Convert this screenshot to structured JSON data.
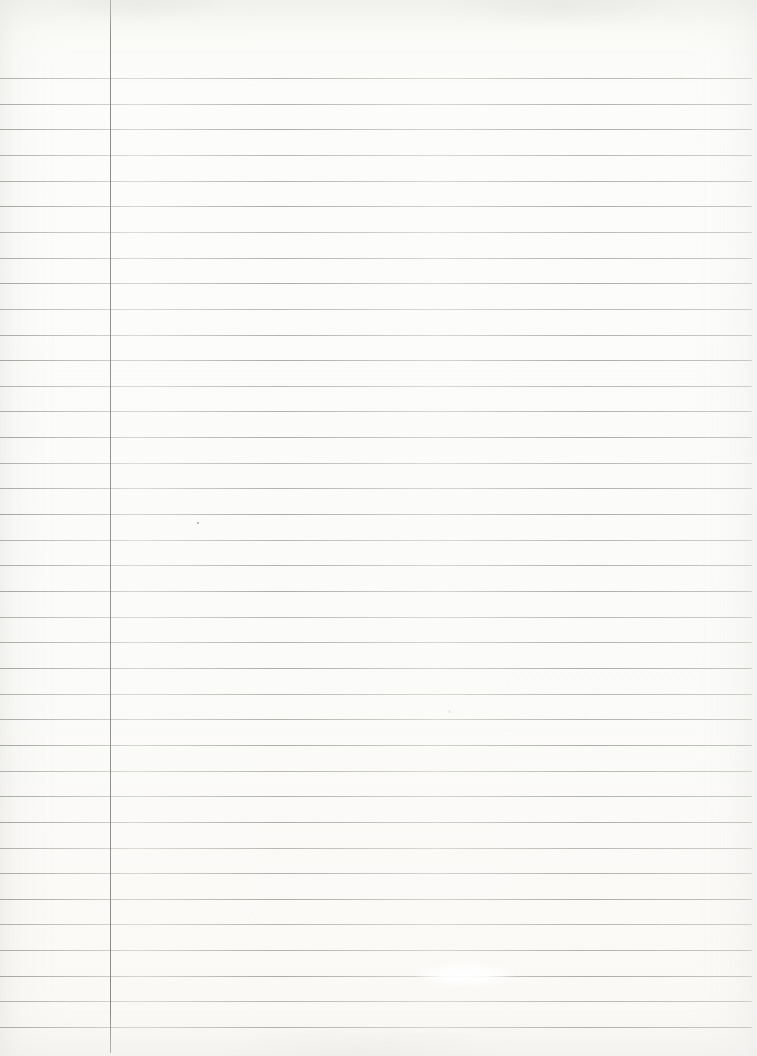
{
  "document": {
    "type": "ruled-notebook-paper",
    "description": "Blank scanned sheet of lined notebook paper with a single vertical left margin rule; no written text",
    "text_content": "",
    "page": {
      "width": 757,
      "height": 1056
    },
    "paper_color": "#fbfbf9",
    "ruling": {
      "line_count": 38,
      "first_line_y": 78,
      "line_spacing": 25.65,
      "line_left": 0,
      "line_right": 752,
      "line_thickness": 1,
      "line_color": "#aaaaa7"
    },
    "margin_rule": {
      "x": 110,
      "top": 0,
      "bottom": 1053,
      "thickness": 1,
      "color": "#878785"
    },
    "marks": [
      {
        "type": "pencil-speck",
        "x": 197,
        "y": 522,
        "size": 2,
        "color": "#8f8f8c"
      },
      {
        "type": "faint-smudge",
        "x": 448,
        "y": 710,
        "size": 3,
        "color": "#e9e9e4"
      },
      {
        "type": "scan-glare-spot",
        "x": 465,
        "y": 975,
        "radius": 50
      }
    ]
  }
}
